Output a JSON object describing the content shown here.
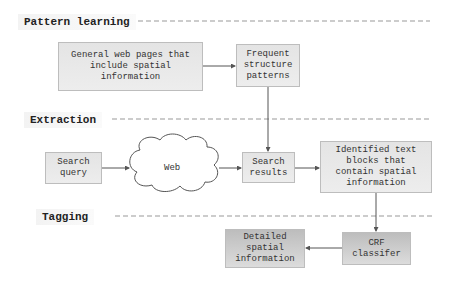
{
  "sections": {
    "pattern_learning": "Pattern learning",
    "extraction": "Extraction",
    "tagging": "Tagging"
  },
  "nodes": {
    "general_web_pages": "General web pages that\ninclude spatial\ninformation",
    "frequent_patterns": "Frequent\nstructure\npatterns",
    "search_query": "Search\nquery",
    "web": "Web",
    "search_results": "Search\nresults",
    "identified_blocks": "Identified text\nblocks that\ncontain spatial\ninformation",
    "crf_classifier": "CRF\nclassifer",
    "detailed_info": "Detailed\nspatial\ninformation"
  }
}
